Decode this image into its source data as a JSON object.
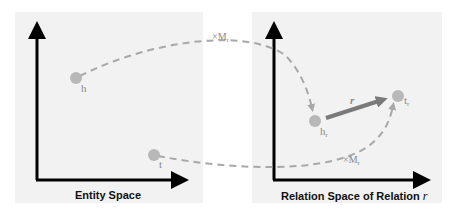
{
  "left_panel": {
    "caption": "Entity Space",
    "points": [
      {
        "id": "h",
        "label": "h",
        "x": 76,
        "y": 78
      },
      {
        "id": "t",
        "label": "t",
        "x": 154,
        "y": 155
      }
    ]
  },
  "right_panel": {
    "caption": "Relation Space of Relation",
    "caption_var": "r",
    "points": [
      {
        "id": "h_r",
        "label": "h",
        "sub": "r",
        "x": 315,
        "y": 121
      },
      {
        "id": "t_r",
        "label": "t",
        "sub": "r",
        "x": 398,
        "y": 96
      }
    ],
    "relation_vector": {
      "label": "r",
      "from": "h_r",
      "to": "t_r"
    }
  },
  "projections": [
    {
      "label": "×M",
      "sub": "r",
      "from": "h",
      "to": "h_r"
    },
    {
      "label": "×M",
      "sub": "r",
      "from": "t",
      "to": "t_r"
    }
  ],
  "colors": {
    "panel_bg": "#f2f2f2",
    "axis": "#000000",
    "point": "#b8b8b8",
    "dashed": "#a8a8a8",
    "vector": "#7a7a7a",
    "label": "#8a8a8a"
  }
}
